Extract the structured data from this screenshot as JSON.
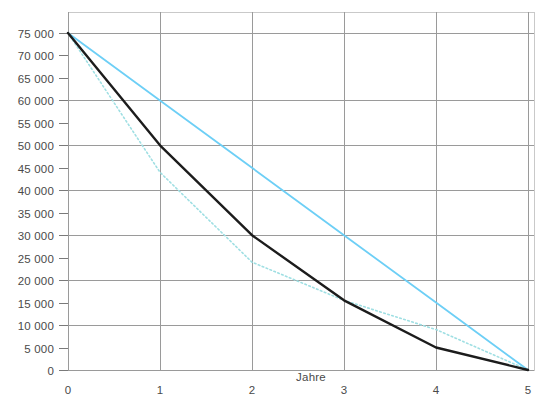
{
  "chart_data": {
    "type": "line",
    "title": "",
    "xlabel": "Jahre",
    "ylabel": "",
    "x": [
      0,
      1,
      2,
      3,
      4,
      5
    ],
    "xlim": [
      0,
      5
    ],
    "ylim": [
      0,
      75000
    ],
    "grid": true,
    "legend_position": "none",
    "x_ticks": [
      "0",
      "1",
      "2",
      "3",
      "4",
      "5"
    ],
    "y_ticks": [
      "75 000",
      "70 000",
      "65 000",
      "60 000",
      "55 000",
      "50 000",
      "45 000",
      "40 000",
      "35 000",
      "30 000",
      "25 000",
      "20 000",
      "15 000",
      "10 000",
      "5 000",
      "0"
    ],
    "y_tick_values": [
      75000,
      70000,
      65000,
      60000,
      55000,
      50000,
      45000,
      40000,
      35000,
      30000,
      25000,
      20000,
      15000,
      10000,
      5000,
      0
    ],
    "y_gridline_values": [
      75000,
      60000,
      50000,
      40000,
      30000,
      20000,
      10000,
      0
    ],
    "series": [
      {
        "name": "degressive-abschreibung",
        "style": "solid",
        "color": "#1c1c1c",
        "width": 2.4,
        "values": [
          75000,
          50000,
          30000,
          15500,
          5000,
          0
        ]
      },
      {
        "name": "lineare-abschreibung",
        "style": "solid",
        "color": "#6dcff6",
        "width": 1.8,
        "values": [
          75000,
          60000,
          45000,
          30000,
          15000,
          0
        ]
      },
      {
        "name": "leistungsabschreibung",
        "style": "dotted",
        "color": "#9fdfe3",
        "width": 1.6,
        "values": [
          75000,
          44000,
          24000,
          15500,
          9000,
          0
        ]
      }
    ]
  },
  "axis": {
    "x_label_text": "Jahre"
  },
  "colors": {
    "grid": "#9a9a9a",
    "axis": "#7a7a7a",
    "text": "#4a4a4a",
    "series_black": "#1c1c1c",
    "series_cyan": "#6dcff6",
    "series_cyan_dotted": "#9fdfe3",
    "border": "#c9c9c9",
    "background": "#ffffff"
  }
}
